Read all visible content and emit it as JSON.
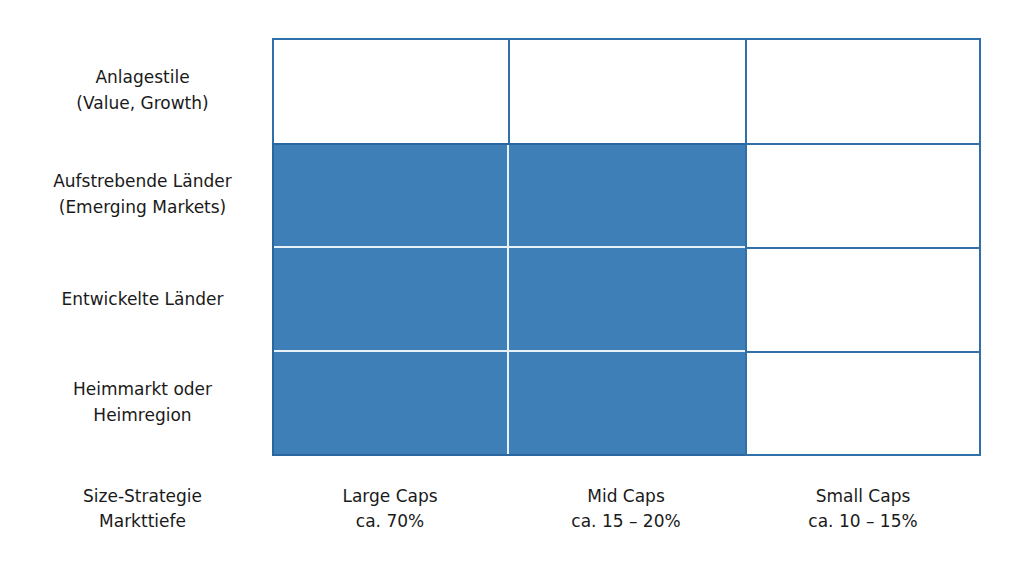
{
  "rows": [
    {
      "line1": "Anlagestile",
      "line2": "(Value, Growth)"
    },
    {
      "line1": "Aufstrebende Länder",
      "line2": "(Emerging Markets)"
    },
    {
      "line1": "Entwickelte Länder",
      "line2": ""
    },
    {
      "line1": "Heimmarkt oder",
      "line2": "Heimregion"
    }
  ],
  "axis_label": {
    "line1": "Size-Strategie",
    "line2": "Markttiefe"
  },
  "columns": [
    {
      "line1": "Large Caps",
      "line2": "ca. 70%"
    },
    {
      "line1": "Mid Caps",
      "line2": "ca. 15 – 20%"
    },
    {
      "line1": "Small Caps",
      "line2": "ca. 10 – 15%"
    }
  ],
  "colors": {
    "fill": "#3f7fb8",
    "border": "#2f6faa"
  },
  "filled_cells": "Rows 2–4 × Large Caps and Mid Caps"
}
